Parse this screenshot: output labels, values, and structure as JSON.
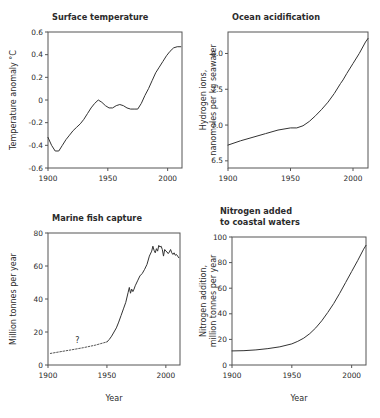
{
  "figure": {
    "background_color": "#ffffff",
    "line_color": "#333333",
    "axis_color": "#555555",
    "text_color": "#2b2b2b"
  },
  "chart_data": [
    {
      "id": "surface-temperature",
      "type": "line",
      "title": "Surface temperature",
      "xlabel": "",
      "ylabel": "Temperature anomaly °C",
      "ylabel_lines": [
        "Temperature anomaly °C"
      ],
      "xlim": [
        1900,
        2012
      ],
      "ylim": [
        -0.6,
        0.6
      ],
      "xticks": [
        1900,
        1950,
        2000
      ],
      "xticklabels": [
        "1900",
        "1950",
        "2000"
      ],
      "yticks": [
        -0.6,
        -0.4,
        -0.2,
        0,
        0.2,
        0.4,
        0.6
      ],
      "yticklabels": [
        "-0.6",
        "-0.4",
        "-0.2",
        "0",
        "0.2",
        "0.4",
        "0.6"
      ],
      "grid": false,
      "legend": "none",
      "series": [
        {
          "name": "Temperature anomaly",
          "style": "solid",
          "x": [
            1900,
            1903,
            1906,
            1909,
            1912,
            1915,
            1918,
            1921,
            1924,
            1927,
            1930,
            1933,
            1936,
            1939,
            1942,
            1945,
            1948,
            1951,
            1954,
            1957,
            1960,
            1963,
            1966,
            1969,
            1972,
            1975,
            1978,
            1981,
            1984,
            1987,
            1990,
            1993,
            1996,
            1999,
            2002,
            2005,
            2008,
            2011
          ],
          "y": [
            -0.33,
            -0.4,
            -0.45,
            -0.45,
            -0.4,
            -0.35,
            -0.31,
            -0.27,
            -0.24,
            -0.21,
            -0.17,
            -0.12,
            -0.07,
            -0.03,
            0.0,
            -0.02,
            -0.05,
            -0.07,
            -0.07,
            -0.05,
            -0.04,
            -0.05,
            -0.07,
            -0.08,
            -0.08,
            -0.08,
            -0.03,
            0.04,
            0.1,
            0.17,
            0.24,
            0.29,
            0.34,
            0.39,
            0.43,
            0.46,
            0.47,
            0.47
          ]
        }
      ]
    },
    {
      "id": "ocean-acidification",
      "type": "line",
      "title": "Ocean acidification",
      "xlabel": "",
      "ylabel": "Hydrogen ions, nanomoles per kg seawater",
      "ylabel_lines": [
        "Hydrogen ions,",
        "nanomoles per kg seawater"
      ],
      "xlim": [
        1900,
        2012
      ],
      "ylim": [
        6.4,
        8.3
      ],
      "xticks": [
        1900,
        1950,
        2000
      ],
      "xticklabels": [
        "1900",
        "1950",
        "2000"
      ],
      "yticks": [
        6.5,
        7.0,
        7.5,
        8.0
      ],
      "yticklabels": [
        "6.5",
        "7.0",
        "7.5",
        "8.0"
      ],
      "grid": false,
      "legend": "none",
      "series": [
        {
          "name": "Hydrogen ion concentration",
          "style": "solid",
          "x": [
            1900,
            1910,
            1920,
            1930,
            1940,
            1950,
            1955,
            1960,
            1965,
            1970,
            1975,
            1980,
            1985,
            1990,
            1992,
            1995,
            2000,
            2005,
            2010,
            2012
          ],
          "y": [
            6.72,
            6.78,
            6.83,
            6.88,
            6.93,
            6.96,
            6.96,
            6.99,
            7.05,
            7.13,
            7.22,
            7.32,
            7.44,
            7.58,
            7.63,
            7.72,
            7.86,
            8.0,
            8.16,
            8.21
          ]
        }
      ]
    },
    {
      "id": "marine-fish-capture",
      "type": "line",
      "title": "Marine fish capture",
      "xlabel": "Year",
      "ylabel": "Million tonnes per year",
      "ylabel_lines": [
        "Million tonnes per year"
      ],
      "xlim": [
        1900,
        2012
      ],
      "ylim": [
        0,
        80
      ],
      "xticks": [
        1900,
        1950,
        2000
      ],
      "xticklabels": [
        "1900",
        "1950",
        "2000"
      ],
      "yticks": [
        0,
        20,
        40,
        60,
        80
      ],
      "yticklabels": [
        "0",
        "20",
        "40",
        "60",
        "80"
      ],
      "grid": false,
      "legend": "none",
      "annotations": [
        {
          "text": "?",
          "x": 1925,
          "y": 13.5,
          "name": "uncertainty-question-mark"
        }
      ],
      "series": [
        {
          "name": "Estimated capture (uncertain)",
          "style": "dotted",
          "x": [
            1902,
            1910,
            1920,
            1930,
            1940,
            1950
          ],
          "y": [
            7.0,
            8.0,
            9.2,
            10.5,
            12.0,
            14.0
          ]
        },
        {
          "name": "Marine fish capture",
          "style": "solid",
          "x": [
            1950,
            1952,
            1954,
            1956,
            1958,
            1960,
            1962,
            1964,
            1966,
            1968,
            1969,
            1970,
            1971,
            1972,
            1973,
            1974,
            1976,
            1978,
            1980,
            1982,
            1984,
            1986,
            1988,
            1989,
            1990,
            1991,
            1992,
            1993,
            1994,
            1995,
            1996,
            1997,
            1998,
            1999,
            2000,
            2001,
            2002,
            2003,
            2004,
            2005,
            2006,
            2007,
            2008,
            2009,
            2010,
            2011
          ],
          "y": [
            14.0,
            15.5,
            17.5,
            20.0,
            22.5,
            26.0,
            30.0,
            34.0,
            38.0,
            44.0,
            47.0,
            43.5,
            46.0,
            44.5,
            46.0,
            48.0,
            51.0,
            54.0,
            55.5,
            58.0,
            61.0,
            66.0,
            69.0,
            72.0,
            69.5,
            68.0,
            70.5,
            69.0,
            72.5,
            71.5,
            72.0,
            70.0,
            66.0,
            70.0,
            69.0,
            68.5,
            67.5,
            68.5,
            70.0,
            68.0,
            67.0,
            68.0,
            66.5,
            67.0,
            66.0,
            65.0
          ]
        }
      ]
    },
    {
      "id": "nitrogen-added",
      "type": "line",
      "title": "Nitrogen added to coastal waters",
      "title_lines": [
        "Nitrogen added",
        "to coastal waters"
      ],
      "xlabel": "Year",
      "ylabel": "Nitrogen addition, million tonnes per year",
      "ylabel_lines": [
        "Nitrogen addition,",
        "million tonnes per year"
      ],
      "xlim": [
        1900,
        2012
      ],
      "ylim": [
        0,
        100
      ],
      "xticks": [
        1900,
        1950,
        2000
      ],
      "xticklabels": [
        "1900",
        "1950",
        "2000"
      ],
      "yticks": [
        0,
        20,
        40,
        60,
        80,
        100
      ],
      "yticklabels": [
        "0",
        "20",
        "40",
        "60",
        "80",
        "100"
      ],
      "grid": false,
      "legend": "none",
      "series": [
        {
          "name": "Nitrogen addition",
          "style": "solid",
          "x": [
            1900,
            1910,
            1920,
            1930,
            1940,
            1950,
            1955,
            1960,
            1965,
            1970,
            1975,
            1980,
            1985,
            1990,
            1995,
            2000,
            2005,
            2010,
            2012
          ],
          "y": [
            11.0,
            11.2,
            11.8,
            12.8,
            14.2,
            16.5,
            18.5,
            21.0,
            24.5,
            29.0,
            34.5,
            41.0,
            48.0,
            56.0,
            64.5,
            73.0,
            81.5,
            90.5,
            93.5
          ]
        }
      ]
    }
  ]
}
